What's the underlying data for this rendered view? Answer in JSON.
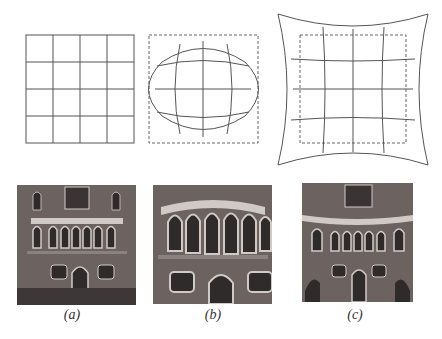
{
  "figure": {
    "panels": [
      {
        "id": "a",
        "caption": "(a)",
        "diagram": "regular-grid",
        "photo": "undistorted building facade"
      },
      {
        "id": "b",
        "caption": "(b)",
        "diagram": "barrel-distortion-grid",
        "photo": "barrel-distorted building facade"
      },
      {
        "id": "c",
        "caption": "(c)",
        "diagram": "pincushion-distortion-grid",
        "photo": "pincushion-distorted building facade"
      }
    ],
    "grid_divisions": 4,
    "colors": {
      "line": "#555555",
      "dashed": "#666666",
      "brick": "#6c625f",
      "stone": "#cfcac6",
      "window": "#2f2b2a"
    }
  }
}
